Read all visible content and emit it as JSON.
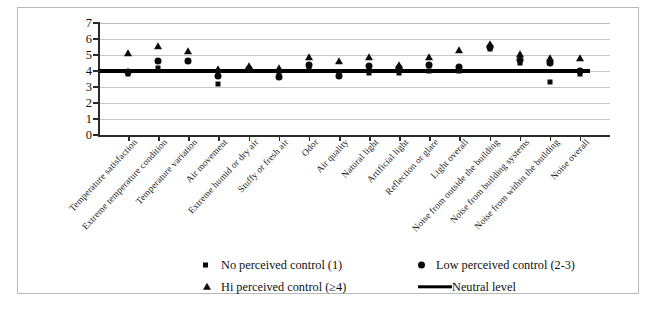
{
  "chart_data": {
    "type": "scatter",
    "title": "",
    "xlabel": "",
    "ylabel": "Perceived comfort",
    "ylim": [
      0,
      7
    ],
    "yticks": [
      0,
      1,
      2,
      3,
      4,
      5,
      6,
      7
    ],
    "grid": true,
    "legend_position": "bottom",
    "categories": [
      "Temperature satisfaction",
      "Extreme temperature condition",
      "Temperature variation",
      "Air movement",
      "Extreme humid or dry air",
      "Stuffy or fresh air",
      "Odor",
      "Air quality",
      "Natural light",
      "Artificial light",
      "Reflection or glare",
      "Light overall",
      "Noise from outside the building",
      "Noise from building systems",
      "Noise from within the building",
      "Noise overall"
    ],
    "series": [
      {
        "name": "No perceived control (1)",
        "marker": "square",
        "values": [
          3.8,
          4.2,
          4.6,
          3.2,
          4.1,
          3.9,
          4.2,
          3.9,
          3.9,
          3.9,
          4.0,
          4.0,
          5.4,
          4.5,
          3.3,
          3.8
        ]
      },
      {
        "name": "Low perceived control (2-3)",
        "marker": "circle",
        "values": [
          3.95,
          4.65,
          4.65,
          3.7,
          4.1,
          3.6,
          4.35,
          3.7,
          4.3,
          4.2,
          4.35,
          4.25,
          5.5,
          4.7,
          4.5,
          4.0
        ]
      },
      {
        "name": "Hi perceived control (≥4)",
        "marker": "triangle",
        "values": [
          5.1,
          5.55,
          5.25,
          4.1,
          4.3,
          4.2,
          4.85,
          4.65,
          4.9,
          4.35,
          4.85,
          5.3,
          5.7,
          5.05,
          4.8,
          4.8
        ]
      }
    ],
    "reference_line": {
      "name": "Neutral level",
      "value": 4
    }
  },
  "legend": {
    "entries": [
      {
        "label": "No perceived control (1)",
        "marker": "square"
      },
      {
        "label": "Low perceived control (2-3)",
        "marker": "circle"
      },
      {
        "label": "Hi perceived control (≥4)",
        "marker": "triangle"
      },
      {
        "label": "Neutral level",
        "marker": "line"
      }
    ]
  }
}
